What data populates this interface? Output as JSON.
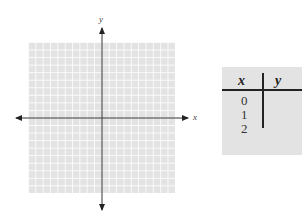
{
  "graph": {
    "x_axis_label": "x",
    "y_axis_label": "y",
    "grid": {
      "columns": 20,
      "rows": 20,
      "color": "#e3e3e3"
    }
  },
  "table": {
    "headers": [
      "x",
      "y"
    ],
    "rows": [
      {
        "x": "0",
        "y": ""
      },
      {
        "x": "1",
        "y": ""
      },
      {
        "x": "2",
        "y": ""
      }
    ]
  }
}
